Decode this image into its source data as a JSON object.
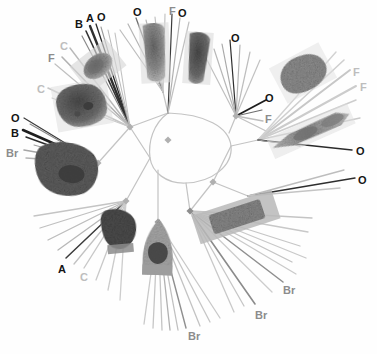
{
  "figure": {
    "width": 377,
    "height": 354,
    "background": "#fefefe",
    "center": {
      "x": 168,
      "y": 140
    }
  },
  "palette": {
    "branch_light": "#c9c9c9",
    "branch_mid": "#a8a8a8",
    "branch_dark": "#303030",
    "node_marker": "#b0b0b0",
    "label_dark": "#141414",
    "label_mid": "#8c8c8c",
    "label_light": "#bdbdbd"
  },
  "legend_codes": [
    "O",
    "B",
    "A",
    "F",
    "C",
    "Br"
  ],
  "tip_labels": [
    {
      "id": "lbl-b-topleft",
      "text": "B",
      "x": 75,
      "y": 19,
      "tone": "dark",
      "size": 11
    },
    {
      "id": "lbl-a-topleft",
      "text": "A",
      "x": 86,
      "y": 13,
      "tone": "dark",
      "size": 11
    },
    {
      "id": "lbl-o-topleft",
      "text": "O",
      "x": 97,
      "y": 12,
      "tone": "dark",
      "size": 11
    },
    {
      "id": "lbl-c-upper",
      "text": "C",
      "x": 60,
      "y": 41,
      "tone": "light",
      "size": 11
    },
    {
      "id": "lbl-f-upper",
      "text": "F",
      "x": 48,
      "y": 53,
      "tone": "mid",
      "size": 11
    },
    {
      "id": "lbl-c-left",
      "text": "C",
      "x": 37,
      "y": 84,
      "tone": "light",
      "size": 11
    },
    {
      "id": "lbl-o-left",
      "text": "O",
      "x": 11,
      "y": 113,
      "tone": "dark",
      "size": 11
    },
    {
      "id": "lbl-b-left",
      "text": "B",
      "x": 11,
      "y": 128,
      "tone": "dark",
      "size": 11
    },
    {
      "id": "lbl-br-left",
      "text": "Br",
      "x": 6,
      "y": 148,
      "tone": "mid",
      "size": 11
    },
    {
      "id": "lbl-o-topcenter",
      "text": "O",
      "x": 133,
      "y": 7,
      "tone": "dark",
      "size": 11
    },
    {
      "id": "lbl-f-topright",
      "text": "F",
      "x": 169,
      "y": 6,
      "tone": "mid",
      "size": 11
    },
    {
      "id": "lbl-o-topright",
      "text": "O",
      "x": 178,
      "y": 8,
      "tone": "dark",
      "size": 11
    },
    {
      "id": "lbl-o-uright",
      "text": "O",
      "x": 231,
      "y": 33,
      "tone": "dark",
      "size": 11
    },
    {
      "id": "lbl-o-right-mid",
      "text": "O",
      "x": 265,
      "y": 93,
      "tone": "dark",
      "size": 11
    },
    {
      "id": "lbl-f-right-mid",
      "text": "F",
      "x": 265,
      "y": 114,
      "tone": "mid",
      "size": 11
    },
    {
      "id": "lbl-f-far1",
      "text": "F",
      "x": 353,
      "y": 67,
      "tone": "light",
      "size": 11
    },
    {
      "id": "lbl-f-far2",
      "text": "F",
      "x": 360,
      "y": 82,
      "tone": "light",
      "size": 11
    },
    {
      "id": "lbl-o-far1",
      "text": "O",
      "x": 356,
      "y": 146,
      "tone": "dark",
      "size": 11
    },
    {
      "id": "lbl-o-far2",
      "text": "O",
      "x": 358,
      "y": 175,
      "tone": "dark",
      "size": 11
    },
    {
      "id": "lbl-a-bottom",
      "text": "A",
      "x": 58,
      "y": 264,
      "tone": "dark",
      "size": 11
    },
    {
      "id": "lbl-c-bottom",
      "text": "C",
      "x": 80,
      "y": 272,
      "tone": "light",
      "size": 11
    },
    {
      "id": "lbl-br-bot1",
      "text": "Br",
      "x": 283,
      "y": 285,
      "tone": "mid",
      "size": 11
    },
    {
      "id": "lbl-br-bot2",
      "text": "Br",
      "x": 255,
      "y": 310,
      "tone": "mid",
      "size": 11
    },
    {
      "id": "lbl-br-bot3",
      "text": "Br",
      "x": 188,
      "y": 331,
      "tone": "mid",
      "size": 11
    }
  ],
  "internal_nodes": [
    {
      "id": "node-root",
      "x": 168,
      "y": 140,
      "size": 5
    },
    {
      "id": "node-upper-left",
      "x": 130,
      "y": 127,
      "size": 5
    },
    {
      "id": "node-left",
      "x": 98,
      "y": 163,
      "size": 5
    },
    {
      "id": "node-lower-left",
      "x": 126,
      "y": 201,
      "size": 5
    },
    {
      "id": "node-lower-mid",
      "x": 158,
      "y": 222,
      "size": 5
    },
    {
      "id": "node-lower-right",
      "x": 190,
      "y": 211,
      "size": 5
    },
    {
      "id": "node-right",
      "x": 213,
      "y": 182,
      "size": 5
    },
    {
      "id": "node-upper-right",
      "x": 236,
      "y": 116,
      "size": 5
    }
  ],
  "micrographs": [
    {
      "id": "mg-top-left-ovoid",
      "cx": 98,
      "cy": 66,
      "w": 40,
      "h": 30,
      "rot": -38,
      "tone": "#8d8d8d",
      "shape": "ellipse",
      "label": "ovoid-cell-micrograph"
    },
    {
      "id": "mg-top-center-rod",
      "cx": 155,
      "cy": 53,
      "w": 28,
      "h": 58,
      "rot": -4,
      "tone": "#9a9a9a",
      "shape": "rod",
      "label": "elongate-cell-micrograph"
    },
    {
      "id": "mg-top-right-rod",
      "cx": 198,
      "cy": 58,
      "w": 26,
      "h": 50,
      "rot": 4,
      "tone": "#8f8f8f",
      "shape": "rod",
      "label": "conical-cell-micrograph"
    },
    {
      "id": "mg-upper-right-blob",
      "cx": 303,
      "cy": 73,
      "w": 54,
      "h": 38,
      "rot": -28,
      "tone": "#8a8a8a",
      "shape": "blob",
      "label": "granular-aggregate-micrograph"
    },
    {
      "id": "mg-right-filament",
      "cx": 311,
      "cy": 131,
      "w": 86,
      "h": 22,
      "rot": -24,
      "tone": "#9c9c9c",
      "shape": "filament",
      "label": "filamentous-cell-micrograph"
    },
    {
      "id": "mg-left-large",
      "cx": 82,
      "cy": 105,
      "w": 54,
      "h": 44,
      "rot": -12,
      "tone": "#7c7c7c",
      "shape": "blob",
      "label": "large-cell-micrograph"
    },
    {
      "id": "mg-left-lower",
      "cx": 70,
      "cy": 168,
      "w": 62,
      "h": 52,
      "rot": 6,
      "tone": "#6f6f6f",
      "shape": "blob",
      "label": "dark-cell-micrograph"
    },
    {
      "id": "mg-bottom-mid-a",
      "cx": 120,
      "cy": 230,
      "w": 34,
      "h": 40,
      "rot": -6,
      "tone": "#5c5c5c",
      "shape": "blob",
      "label": "dark-ovoid-micrograph"
    },
    {
      "id": "mg-bottom-mid-b",
      "cx": 158,
      "cy": 249,
      "w": 32,
      "h": 56,
      "rot": 2,
      "tone": "#9a9a9a",
      "shape": "vase",
      "label": "vase-cell-micrograph"
    },
    {
      "id": "mg-bottom-right-bar",
      "cx": 236,
      "cy": 217,
      "w": 82,
      "h": 30,
      "rot": -18,
      "tone": "#8e8e8e",
      "shape": "bar",
      "label": "rectangular-cell-micrograph"
    }
  ],
  "branch_groups": [
    {
      "id": "fan-top-left",
      "note": "upper-left radiating tips, mixed dark and light"
    },
    {
      "id": "fan-top-center",
      "note": "top radiating tips"
    },
    {
      "id": "fan-top-right",
      "note": "upper-right radiating tips"
    },
    {
      "id": "fan-right",
      "note": "right radiating tips"
    },
    {
      "id": "fan-left",
      "note": "left radiating tips"
    },
    {
      "id": "fan-bottom-left",
      "note": "lower-left radiating tips"
    },
    {
      "id": "fan-bottom",
      "note": "bottom radiating tips"
    },
    {
      "id": "fan-bottom-right",
      "note": "lower-right radiating tips"
    }
  ]
}
